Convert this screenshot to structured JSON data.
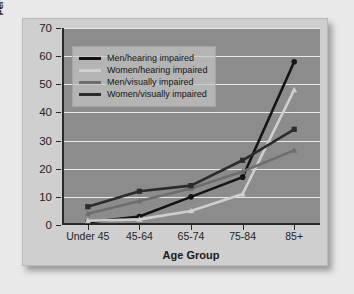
{
  "chart_data": {
    "type": "line",
    "title": "",
    "xlabel": "Age Group",
    "ylabel": "Percentage of Individuals Reporting Difficulty",
    "ylabel_line1": "Percentage of Individuals Reporting",
    "ylabel_line2": "Difficulty",
    "categories": [
      "Under 45",
      "45-64",
      "65-74",
      "75-84",
      "85+"
    ],
    "ylim": [
      0,
      70
    ],
    "yticks": [
      0,
      10,
      20,
      30,
      40,
      50,
      60,
      70
    ],
    "grid": "horizontal",
    "legend_position": "upper-left-inside",
    "series": [
      {
        "name": "Men/hearing impaired",
        "values": [
          1.0,
          3.0,
          10.0,
          17.0,
          58.0
        ],
        "color": "#141414",
        "marker": "circle"
      },
      {
        "name": "Women/hearing impaired",
        "values": [
          1.5,
          2.0,
          5.0,
          11.0,
          48.0
        ],
        "color": "#cfcfcf",
        "marker": "triangle"
      },
      {
        "name": "Men/visually impaired",
        "values": [
          4.0,
          8.5,
          13.0,
          19.0,
          26.5
        ],
        "color": "#6e6e6e",
        "marker": "triangle"
      },
      {
        "name": "Women/visually impaired",
        "values": [
          6.5,
          12.0,
          14.0,
          23.0,
          34.0
        ],
        "color": "#2b2b2b",
        "marker": "square"
      }
    ]
  },
  "colors": {
    "page_background": "#e9e9e9",
    "plot_background": "#8c8c8c",
    "gridline": "#e8e8e8",
    "axis": "#2a2a2a",
    "legend_background": "#c4c4c4",
    "text": "#1a1a1a"
  }
}
